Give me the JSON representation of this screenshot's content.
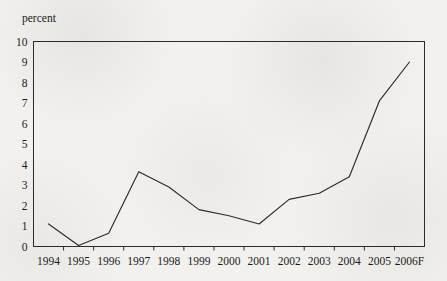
{
  "chart_data": {
    "type": "line",
    "title": "",
    "subtitle": "",
    "xlabel": "",
    "ylabel": "percent",
    "ylabel_position": "above-axis-top-left",
    "categories": [
      "1994",
      "1995",
      "1996",
      "1997",
      "1998",
      "1999",
      "2000",
      "2001",
      "2002",
      "2003",
      "2004",
      "2005",
      "2006F"
    ],
    "values": [
      1.1,
      0.05,
      0.65,
      3.65,
      2.9,
      1.8,
      1.5,
      1.1,
      2.3,
      2.6,
      3.4,
      7.1,
      9.0
    ],
    "series": [
      {
        "name": "percent",
        "values": [
          1.1,
          0.05,
          0.65,
          3.65,
          2.9,
          1.8,
          1.5,
          1.1,
          2.3,
          2.6,
          3.4,
          7.1,
          9.0
        ]
      }
    ],
    "ylim": [
      0,
      10
    ],
    "ytick_labels": [
      "0",
      "1",
      "2",
      "3",
      "4",
      "5",
      "6",
      "7",
      "8",
      "9",
      "10"
    ],
    "ytick_values": [
      0,
      1,
      2,
      3,
      4,
      5,
      6,
      7,
      8,
      9,
      10
    ],
    "xtick_labels": [
      "1994",
      "1995",
      "1996",
      "1997",
      "1998",
      "1999",
      "2000",
      "2001",
      "2002",
      "2003",
      "2004",
      "2005",
      "2006F"
    ],
    "grid": false,
    "legend": false,
    "legend_position": "none",
    "frame": "box",
    "line_color": "#2b2b2b",
    "background_color": "#f2f1ee",
    "annotations": []
  },
  "axis": {
    "y_unit_label": "percent"
  }
}
